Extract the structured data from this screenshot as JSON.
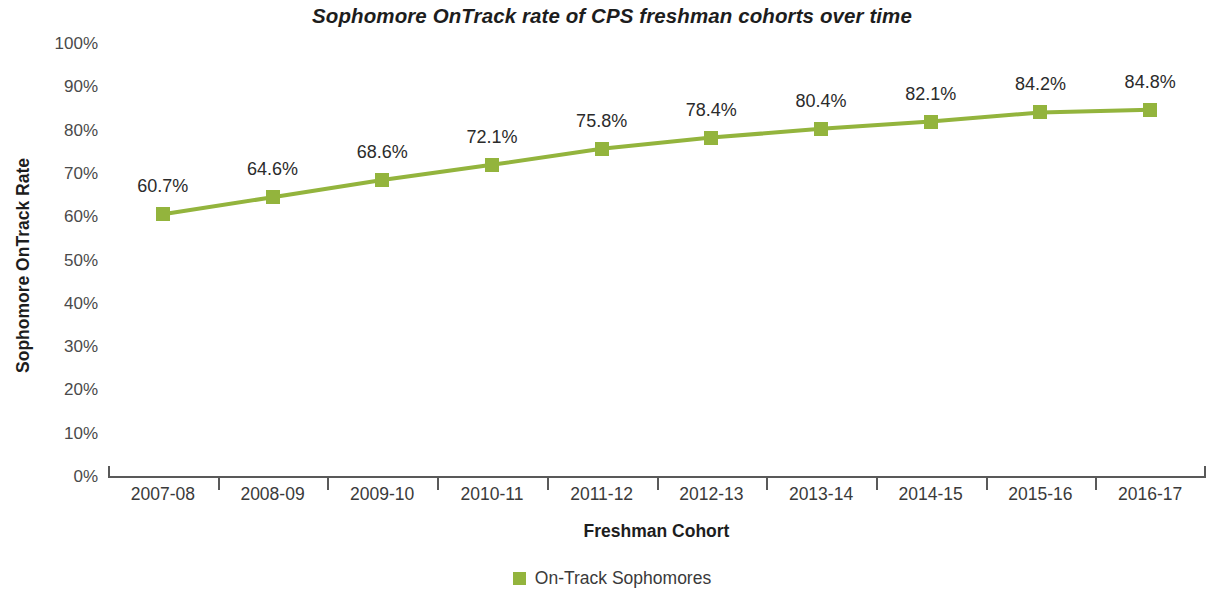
{
  "chart_data": {
    "type": "line",
    "title": "Sophomore OnTrack rate of CPS freshman cohorts over time",
    "xlabel": "Freshman Cohort",
    "ylabel": "Sophomore OnTrack Rate",
    "categories": [
      "2007-08",
      "2008-09",
      "2009-10",
      "2010-11",
      "2011-12",
      "2012-13",
      "2013-14",
      "2014-15",
      "2015-16",
      "2016-17"
    ],
    "values": [
      60.7,
      64.6,
      68.6,
      72.1,
      75.8,
      78.4,
      80.4,
      82.1,
      84.2,
      84.8
    ],
    "point_labels": [
      "60.7%",
      "64.6%",
      "68.6%",
      "72.1%",
      "75.8%",
      "78.4%",
      "80.4%",
      "82.1%",
      "84.2%",
      "84.8%"
    ],
    "ylim": [
      0,
      100
    ],
    "ytick_values": [
      0,
      10,
      20,
      30,
      40,
      50,
      60,
      70,
      80,
      90,
      100
    ],
    "ytick_labels": [
      "0%",
      "10%",
      "20%",
      "30%",
      "40%",
      "50%",
      "60%",
      "70%",
      "80%",
      "90%",
      "100%"
    ],
    "grid": false,
    "legend_position": "bottom",
    "series": [
      {
        "name": "On-Track Sophomores",
        "color": "#93B43D",
        "marker": "square",
        "values": [
          60.7,
          64.6,
          68.6,
          72.1,
          75.8,
          78.4,
          80.4,
          82.1,
          84.2,
          84.8
        ]
      }
    ]
  },
  "legend": {
    "entries": [
      {
        "label": "On-Track Sophomores",
        "color": "#93B43D"
      }
    ]
  },
  "colors": {
    "series_green": "#93B43D",
    "axis": "#595959",
    "text": "#2b2b2b",
    "background": "#ffffff"
  }
}
